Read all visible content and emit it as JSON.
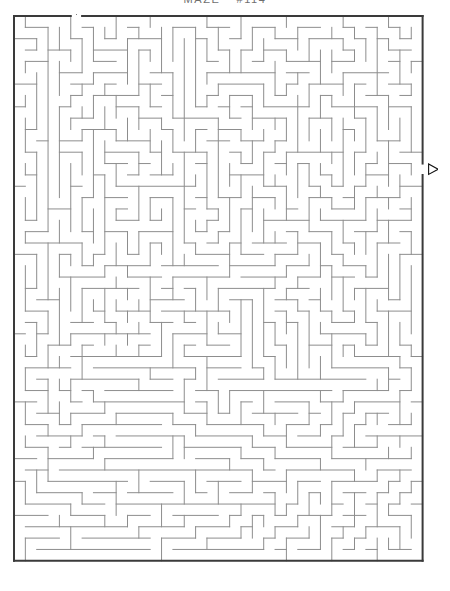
{
  "page": {
    "title_main": "MAZE",
    "title_number": "#114",
    "background_color": "#ffffff"
  },
  "maze": {
    "name": "rectangular-perfect-maze",
    "columns": 36,
    "rows": 48,
    "cell_size_px": 11.35,
    "border_color": "#3a3a3a",
    "wall_color": "#8d8d8d",
    "border_width_px": 2,
    "wall_width_px": 1,
    "entrance": {
      "label": "entrance-marker",
      "glyph": "▽",
      "side": "top",
      "column": 5,
      "direction": "down"
    },
    "exit": {
      "label": "exit-marker",
      "glyph": "▷",
      "side": "right",
      "row": 13,
      "direction": "right"
    },
    "seed": 114
  }
}
